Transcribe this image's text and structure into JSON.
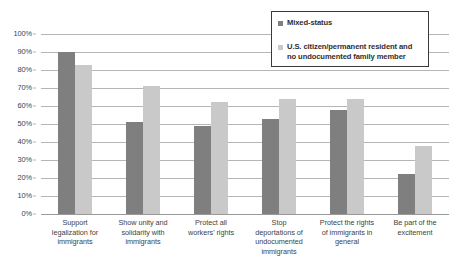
{
  "chart_data": {
    "type": "bar",
    "title": "",
    "xlabel": "",
    "ylabel": "",
    "ylim": [
      0,
      100
    ],
    "ytick_labels": [
      "100%",
      "90%",
      "80%",
      "70%",
      "60%",
      "50%",
      "40%",
      "30%",
      "20%",
      "10%",
      "0%"
    ],
    "ytick_values": [
      100,
      90,
      80,
      70,
      60,
      50,
      40,
      30,
      20,
      10,
      0
    ],
    "grid": true,
    "legend_position": "top-right",
    "categories": [
      "Support legalization for immigrants",
      "Show unity and solidarity with immigrants",
      "Protect all workers' rights",
      "Stop deportations of undocumented immigrants",
      "Protect the rights of immigrants in general",
      "Be part of the excitement"
    ],
    "category_lines": [
      [
        "Support",
        "legalization for",
        "immigrants"
      ],
      [
        "Show unity and",
        "solidarity with",
        "immigrants"
      ],
      [
        "Protect all",
        "workers' rights"
      ],
      [
        "Stop",
        "deportations of",
        "undocumented",
        "immigrants"
      ],
      [
        "Protect the rights",
        "of immigrants in",
        "general"
      ],
      [
        "Be part of the",
        "excitement"
      ]
    ],
    "series": [
      {
        "name": "Mixed-status",
        "color": "#7f7f7f",
        "values": [
          90,
          51,
          49,
          53,
          58,
          22
        ]
      },
      {
        "name": "U.S. citizen/permanent resident and no undocumented family member",
        "color": "#c9c9c9",
        "values": [
          83,
          71,
          62,
          64,
          64,
          38
        ]
      }
    ]
  },
  "legend": {
    "entries": [
      {
        "label": "Mixed-status",
        "swatch_name": "legend-swatch-mixed-status"
      },
      {
        "label_line_1": "U.S. citizen/permanent resident and",
        "label_line_2": "no undocumented family member",
        "swatch_name": "legend-swatch-us-citizen"
      }
    ]
  },
  "colors": {
    "series_mixed_status": "#7f7f7f",
    "series_us_citizen": "#c9c9c9",
    "gridline": "#b5b5b5",
    "legend_border": "#3a3a3a",
    "text": "#3f3f3f"
  }
}
